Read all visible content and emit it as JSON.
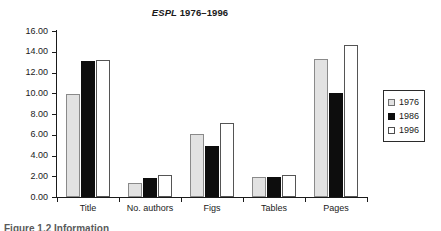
{
  "chart_data": {
    "type": "bar",
    "title": "ESPL 1976–1996",
    "title_emphasis": "ESPL",
    "title_rest": " 1976–1996",
    "xlabel": "",
    "ylabel": "",
    "ylim": [
      0,
      16
    ],
    "ytick_step": 2,
    "ytick_labels": [
      "0.00",
      "2.00",
      "4.00",
      "6.00",
      "8.00",
      "10.00",
      "12.00",
      "14.00",
      "16.00"
    ],
    "ytick_values": [
      0,
      2,
      4,
      6,
      8,
      10,
      12,
      14,
      16
    ],
    "grid": false,
    "legend_position": "right",
    "categories": [
      "Title",
      "No. authors",
      "Figs",
      "Tables",
      "Pages"
    ],
    "series": [
      {
        "name": "1976",
        "color": "#e2e2e2",
        "values": [
          9.9,
          1.35,
          6.1,
          1.95,
          13.35
        ]
      },
      {
        "name": "1986",
        "color": "#0d0d0d",
        "values": [
          13.1,
          1.8,
          4.95,
          1.9,
          10.0
        ]
      },
      {
        "name": "1996",
        "color": "#ffffff",
        "values": [
          13.25,
          2.1,
          7.15,
          2.1,
          14.65
        ]
      }
    ]
  },
  "legend": {
    "items": [
      {
        "label": "1976",
        "swatch": "swatch-1976"
      },
      {
        "label": "1986",
        "swatch": "swatch-1986"
      },
      {
        "label": "1996",
        "swatch": "swatch-1996"
      }
    ]
  },
  "caption": {
    "sliver_text": "Figure 1.2 Information"
  }
}
